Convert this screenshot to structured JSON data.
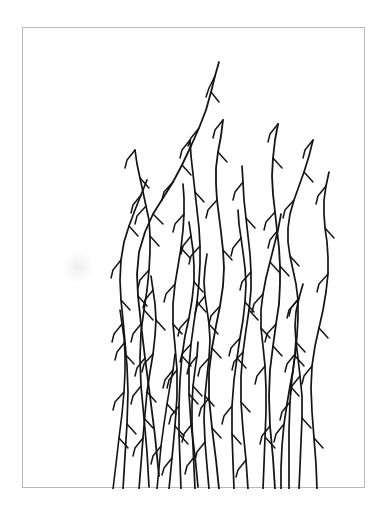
{
  "figure": {
    "caption": "",
    "medium": "ink line drawing"
  },
  "canvas": {
    "width": 389,
    "height": 507,
    "background_color": "#ffffff"
  },
  "frame": {
    "x": 22,
    "y": 27,
    "width": 343,
    "height": 461,
    "border_color": "#b9b9b9",
    "border_width": 1,
    "fill_color": "#ffffff"
  },
  "drawing": {
    "ink_color": "#141414",
    "stem_count": 20,
    "bud_count": 131,
    "horizontal_extent": [
      38,
      272
    ],
    "vertical_extent": [
      26,
      461
    ]
  },
  "chart_data": {
    "type": "line",
    "xlabel": "",
    "ylabel": "",
    "xlim": [
      0,
      343
    ],
    "ylim": [
      0,
      461
    ],
    "grid": false,
    "legend": "none",
    "stroke_color": "#141414",
    "stem_width": 1.7,
    "bud_width": 1.5,
    "series": [
      {
        "name": "stem-1",
        "width": 1.8,
        "path": "M136 448 L132 408 L127 368 L122 330 L118 296 L115 268 L114 246 L116 224 L122 204 L130 186 L140 170 L150 154 L159 137 L168 118 L176 100 L183 82 L188 64 L192 48 L196 34",
        "buds": [
          "M192 48 L186 60 L183 69",
          "M188 64 L196 74",
          "M176 100 L168 110 L165 118",
          "M159 137 L168 147",
          "M150 154 L141 164 L139 172",
          "M130 186 L140 196",
          "M118 296 L110 306 L108 314",
          "M115 268 L124 278",
          "M122 330 L114 340 L112 348"
        ]
      },
      {
        "name": "stem-2",
        "width": 1.7,
        "path": "M126 459 L124 424 L121 390 L118 358 L117 330 L118 304 L121 282 L124 262 L126 242 L127 224 L127 208 L126 192 L123 178 L120 164 L117 150 L114 136 L112 122",
        "buds": [
          "M112 122 L104 132 L102 140",
          "M117 150 L126 160",
          "M123 178 L114 188 L112 196",
          "M127 208 L136 218",
          "M126 242 L117 252 L115 260",
          "M121 282 L130 292",
          "M118 358 L110 368 L108 376",
          "M121 390 L130 400"
        ]
      },
      {
        "name": "stem-3",
        "width": 1.7,
        "path": "M146 461 L149 430 L152 398 L154 368 L154 342 L152 318 L150 296 L150 276 L152 256 L155 238 L158 220 L160 202 L161 186 L161 170 L160 156",
        "buds": [
          "M161 186 L152 196 L150 204",
          "M158 220 L167 230",
          "M152 256 L143 266 L141 274",
          "M150 296 L159 306",
          "M154 342 L146 352 L144 360",
          "M152 398 L161 408",
          "M149 430 L141 440 L139 447"
        ]
      },
      {
        "name": "stem-4",
        "width": 1.7,
        "path": "M175 459 L172 428 L168 396 L166 366 L166 340 L168 316 L171 294 L174 274 L176 254 L177 236 L177 218 L176 200 L174 182 L172 164 L170 146 L168 128 L167 112",
        "buds": [
          "M167 112 L159 122 L157 130",
          "M172 164 L181 174",
          "M177 218 L168 228 L166 236",
          "M174 274 L183 284",
          "M168 316 L159 326 L157 334",
          "M166 366 L175 376",
          "M172 428 L164 438 L162 446"
        ]
      },
      {
        "name": "stem-5",
        "width": 1.8,
        "path": "M196 461 L193 432 L189 400 L186 370 L186 344 L189 320 L193 298 L197 278 L200 258 L201 240 L200 222 L198 204 L196 188 L194 172 L193 156 L193 140 L195 124 L198 108 L200 92",
        "buds": [
          "M200 92 L192 102 L190 110",
          "M195 124 L204 134",
          "M194 172 L185 182 L183 190",
          "M200 222 L209 232",
          "M197 278 L188 288 L186 296",
          "M189 320 L198 330",
          "M186 370 L178 380 L176 388",
          "M189 400 L198 410"
        ]
      },
      {
        "name": "stem-6",
        "width": 1.7,
        "path": "M225 461 L223 432 L220 402 L218 374 L218 348 L220 324 L223 302 L226 282 L228 262 L228 244 L227 226 L225 208 L223 190 L221 172 L220 154 L219 138",
        "buds": [
          "M220 154 L212 164 L210 172",
          "M223 190 L232 200",
          "M228 244 L219 254 L217 262",
          "M226 282 L235 292",
          "M220 324 L211 334 L209 342",
          "M218 374 L227 384",
          "M223 432 L215 442 L213 449"
        ]
      },
      {
        "name": "stem-7",
        "width": 1.8,
        "path": "M252 461 L250 430 L247 398 L246 368 L247 342 L250 318 L253 296 L256 276 L257 256 L257 238 L256 220 L254 202 L252 184 L250 166 L249 148 L250 130 L252 112 L255 96",
        "buds": [
          "M255 96 L247 106 L245 114",
          "M250 130 L259 140",
          "M252 184 L243 194 L241 202",
          "M257 238 L266 248",
          "M253 296 L244 306 L242 314",
          "M250 318 L259 328",
          "M247 398 L239 408 L237 416"
        ]
      },
      {
        "name": "stem-8",
        "width": 1.7,
        "path": "M100 461 L102 428 L104 396 L105 364 L104 338 L102 314 L100 292 L98 272 L97 252 L98 232 L101 214 L106 198 L112 182 L118 167 L124 152",
        "buds": [
          "M118 167 L110 177 L108 185",
          "M106 198 L115 208",
          "M98 232 L90 242 L88 250",
          "M98 272 L107 282",
          "M102 314 L94 324 L92 332",
          "M104 396 L113 406"
        ]
      },
      {
        "name": "stem-9",
        "width": 1.7,
        "path": "M158 461 L157 434 L156 406 L156 378 L157 352 L159 328 L162 308 L166 290 L169 272 L171 254 L171 238 L170 222 L168 208 L166 194",
        "buds": [
          "M168 208 L160 218 L158 226",
          "M171 254 L180 264",
          "M166 290 L157 300 L155 308",
          "M159 328 L168 338",
          "M156 378 L148 388 L146 396",
          "M156 406 L165 416"
        ]
      },
      {
        "name": "stem-10",
        "width": 1.7,
        "path": "M211 461 L210 434 L209 406 L209 378 L211 352 L214 330 L217 310 L220 292 L222 274 L223 256 L222 240 L220 224 L218 210 L216 196 L215 182",
        "buds": [
          "M218 210 L210 220 L208 228",
          "M222 274 L231 284",
          "M217 310 L208 320 L206 328",
          "M214 330 L223 340",
          "M209 378 L201 388 L199 396",
          "M209 406 L218 416"
        ]
      },
      {
        "name": "stem-11",
        "width": 1.7,
        "path": "M266 461 L266 432 L266 402 L267 374 L269 350 L272 328 L274 308 L275 290 L275 272 L273 256 L270 242 L267 228 L265 214 L265 200 L267 186 L271 172 L276 158 L281 144 L286 128 L290 112",
        "buds": [
          "M290 112 L282 122 L280 130",
          "M281 144 L290 154",
          "M271 172 L262 182 L260 190",
          "M267 228 L276 238",
          "M275 272 L266 282 L264 290",
          "M272 328 L281 338",
          "M267 374 L259 384 L257 392"
        ]
      },
      {
        "name": "stem-12",
        "width": 1.7,
        "path": "M240 461 L241 436 L242 410 L243 384 L243 360 L242 338 L240 318 L238 300 L238 282 L240 266 L243 250 L247 234 L251 218 L255 202 L258 186",
        "buds": [
          "M255 202 L247 212 L245 220",
          "M247 234 L256 244",
          "M240 266 L231 276 L229 284",
          "M238 300 L247 310",
          "M242 338 L234 348 L232 356",
          "M243 410 L252 420"
        ]
      },
      {
        "name": "stem-13",
        "width": 1.7,
        "path": "M186 461 L184 438 L182 414 L181 390 L182 368 L184 348 L186 330 L187 312 L186 296 L184 282 L182 268 L181 254 L182 240 L184 226",
        "buds": [
          "M182 268 L174 278 L172 286",
          "M186 296 L195 306",
          "M186 330 L177 340 L175 348",
          "M182 368 L191 378",
          "M182 414 L174 424 L172 432"
        ]
      },
      {
        "name": "stem-14",
        "width": 1.7,
        "path": "M116 461 L118 436 L120 410 L122 386 L124 364 L127 344 L130 326 L132 308 L133 292 L132 276 L130 262 L128 248",
        "buds": [
          "M130 262 L122 272 L120 280",
          "M133 292 L142 302",
          "M130 326 L121 336 L119 344",
          "M124 364 L133 374",
          "M120 410 L112 420 L110 428"
        ]
      },
      {
        "name": "stem-15",
        "width": 1.6,
        "path": "M90 461 L93 436 L96 410 L99 386 L101 364 L102 344 L102 326 L101 310 L99 296 L97 282",
        "buds": [
          "M99 296 L91 306 L89 314",
          "M102 326 L111 336",
          "M101 364 L92 374 L90 382",
          "M96 410 L105 420"
        ]
      },
      {
        "name": "stem-16",
        "width": 1.7,
        "path": "M294 461 L293 436 L291 410 L289 384 L288 360 L289 338 L292 318 L296 300 L300 282 L303 264 L305 246 L305 230 L304 214 L302 200 L301 186 L301 172 L303 158 L306 144",
        "buds": [
          "M303 158 L295 168 L293 176",
          "M302 200 L311 210",
          "M305 246 L296 256 L294 264",
          "M296 300 L305 310",
          "M289 338 L281 348 L279 356",
          "M291 410 L300 420"
        ]
      },
      {
        "name": "stem-17",
        "width": 1.7,
        "path": "M276 461 L277 438 L278 414 L279 390 L279 368 L277 348 L275 330 L273 314 L272 298 L273 284 L276 270 L280 256",
        "buds": [
          "M276 270 L268 280 L266 288",
          "M273 314 L282 324",
          "M277 348 L269 358 L267 366",
          "M279 390 L288 400"
        ]
      },
      {
        "name": "stem-18",
        "width": 1.7,
        "path": "M172 461 L171 440 L170 418 L169 396 L169 376 L170 358 L172 342 L174 328 L175 314",
        "buds": [
          "M174 328 L166 338 L164 346",
          "M170 358 L179 368",
          "M169 396 L161 406 L159 414"
        ]
      },
      {
        "name": "stem-19",
        "width": 1.6,
        "path": "M134 461 L136 440 L138 418 L141 396 L144 376 L147 358 L150 342 L152 326",
        "buds": [
          "M150 342 L142 352 L140 360",
          "M144 376 L153 386",
          "M138 418 L130 428 L128 436"
        ]
      },
      {
        "name": "stem-20",
        "width": 1.7,
        "path": "M258 461 L258 440 L259 418 L261 396 L264 376 L267 358 L270 342 L272 326 L273 310",
        "buds": [
          "M272 326 L264 336 L262 344",
          "M267 358 L276 368",
          "M261 396 L253 406 L251 414"
        ]
      }
    ]
  }
}
